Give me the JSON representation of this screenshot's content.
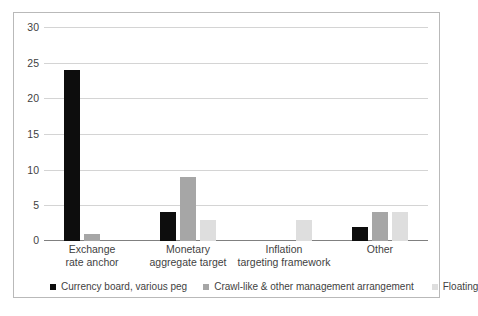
{
  "chart_data": {
    "type": "bar",
    "title": "",
    "xlabel": "",
    "ylabel": "",
    "ylim": [
      0,
      30
    ],
    "yticks": [
      0,
      5,
      10,
      15,
      20,
      25,
      30
    ],
    "ytick_labels": [
      "0",
      "5",
      "10",
      "15",
      "20",
      "25",
      "30"
    ],
    "grid": true,
    "legend_position": "bottom",
    "categories": [
      "Exchange rate anchor",
      "Monetary aggregate target",
      "Inflation targeting framework",
      "Other"
    ],
    "category_lines": [
      [
        "Exchange",
        "rate anchor"
      ],
      [
        "Monetary",
        "aggregate target"
      ],
      [
        "Inflation",
        "targeting framework"
      ],
      [
        "Other",
        ""
      ]
    ],
    "series": [
      {
        "name": "Currency board, various peg",
        "color": "#0d0d0d",
        "values": [
          24,
          4,
          0,
          2
        ]
      },
      {
        "name": "Crawl-like & other management arrangement",
        "color": "#a6a6a6",
        "values": [
          1,
          9,
          0,
          4
        ]
      },
      {
        "name": "Floating",
        "color": "#dedede",
        "values": [
          0,
          3,
          3,
          4
        ]
      }
    ]
  }
}
